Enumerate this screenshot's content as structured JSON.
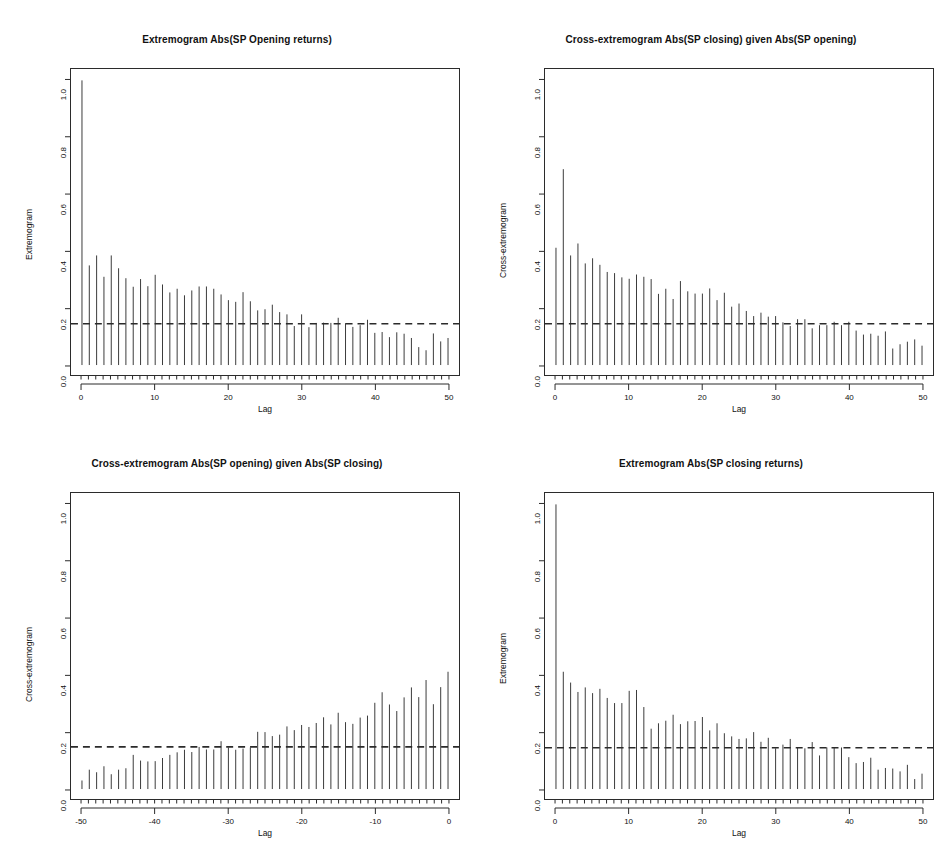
{
  "figure": {
    "width": 948,
    "height": 849,
    "background": "#ffffff",
    "bar_color": "#3a3a3a",
    "axis_color": "#2b2b2b",
    "ci_color": "#2b2b2b",
    "panel_count": 4
  },
  "chart_data": [
    {
      "id": "panel-a",
      "type": "bar",
      "title": "Extremogram Abs(SP Opening returns)",
      "xlabel": "Lag",
      "ylabel": "Extremogram",
      "xlim": [
        -1.5,
        51.5
      ],
      "ylim": [
        -0.035,
        1.04
      ],
      "xticks": [
        0,
        10,
        20,
        30,
        40,
        50
      ],
      "xtick_labels": [
        "0",
        "10",
        "20",
        "30",
        "40",
        "50"
      ],
      "yticks": [
        0.0,
        0.2,
        0.4,
        0.6,
        0.8,
        1.0
      ],
      "ytick_labels": [
        "0.0",
        "0.2",
        "0.4",
        "0.6",
        "0.8",
        "1.0"
      ],
      "grid": false,
      "legend": "none",
      "confidence_level": 0.145,
      "confidence_style": "dashed",
      "x": [
        0,
        1,
        2,
        3,
        4,
        5,
        6,
        7,
        8,
        9,
        10,
        11,
        12,
        13,
        14,
        15,
        16,
        17,
        18,
        19,
        20,
        21,
        22,
        23,
        24,
        25,
        26,
        27,
        28,
        29,
        30,
        31,
        32,
        33,
        34,
        35,
        36,
        37,
        38,
        39,
        40,
        41,
        42,
        43,
        44,
        45,
        46,
        47,
        48,
        49,
        50
      ],
      "values": [
        1.0,
        0.35,
        0.385,
        0.31,
        0.385,
        0.34,
        0.305,
        0.275,
        0.302,
        0.277,
        0.317,
        0.283,
        0.255,
        0.268,
        0.245,
        0.262,
        0.276,
        0.276,
        0.268,
        0.248,
        0.228,
        0.222,
        0.256,
        0.224,
        0.192,
        0.196,
        0.212,
        0.186,
        0.178,
        0.137,
        0.178,
        0.133,
        0.148,
        0.149,
        0.148,
        0.166,
        0.147,
        0.134,
        0.14,
        0.159,
        0.113,
        0.116,
        0.098,
        0.115,
        0.11,
        0.095,
        0.063,
        0.052,
        0.111,
        0.083,
        0.095
      ]
    },
    {
      "id": "panel-b",
      "type": "bar",
      "title": "Cross-extremogram Abs(SP closing) given Abs(SP opening)",
      "xlabel": "Lag",
      "ylabel": "Cross-extremogram",
      "xlim": [
        -1.5,
        51.5
      ],
      "ylim": [
        -0.035,
        1.04
      ],
      "xticks": [
        0,
        10,
        20,
        30,
        40,
        50
      ],
      "xtick_labels": [
        "0",
        "10",
        "20",
        "30",
        "40",
        "50"
      ],
      "yticks": [
        0.0,
        0.2,
        0.4,
        0.6,
        0.8,
        1.0
      ],
      "ytick_labels": [
        "0.0",
        "0.2",
        "0.4",
        "0.6",
        "0.8",
        "1.0"
      ],
      "grid": false,
      "legend": "none",
      "confidence_level": 0.145,
      "confidence_style": "dashed",
      "x": [
        0,
        1,
        2,
        3,
        4,
        5,
        6,
        7,
        8,
        9,
        10,
        11,
        12,
        13,
        14,
        15,
        16,
        17,
        18,
        19,
        20,
        21,
        22,
        23,
        24,
        25,
        26,
        27,
        28,
        29,
        30,
        31,
        32,
        33,
        34,
        35,
        36,
        37,
        38,
        39,
        40,
        41,
        42,
        43,
        44,
        45,
        46,
        47,
        48,
        49,
        50
      ],
      "values": [
        0.412,
        0.688,
        0.385,
        0.427,
        0.357,
        0.375,
        0.352,
        0.327,
        0.323,
        0.308,
        0.303,
        0.318,
        0.31,
        0.302,
        0.25,
        0.268,
        0.232,
        0.295,
        0.259,
        0.251,
        0.251,
        0.269,
        0.228,
        0.254,
        0.205,
        0.216,
        0.19,
        0.172,
        0.184,
        0.17,
        0.172,
        0.15,
        0.137,
        0.161,
        0.161,
        0.129,
        0.14,
        0.14,
        0.152,
        0.14,
        0.152,
        0.121,
        0.107,
        0.11,
        0.103,
        0.118,
        0.058,
        0.073,
        0.082,
        0.09,
        0.068
      ]
    },
    {
      "id": "panel-c",
      "type": "bar",
      "title": "Cross-extremogram Abs(SP opening) given Abs(SP closing)",
      "xlabel": "Lag",
      "ylabel": "Cross-extremogram",
      "xlim": [
        -51.5,
        1.5
      ],
      "ylim": [
        -0.035,
        1.04
      ],
      "xticks": [
        -50,
        -40,
        -30,
        -20,
        -10,
        0
      ],
      "xtick_labels": [
        "-50",
        "-40",
        "-30",
        "-20",
        "-10",
        "0"
      ],
      "yticks": [
        0.0,
        0.2,
        0.4,
        0.6,
        0.8,
        1.0
      ],
      "ytick_labels": [
        "0.0",
        "0.2",
        "0.4",
        "0.6",
        "0.8",
        "1.0"
      ],
      "grid": false,
      "legend": "none",
      "confidence_level": 0.148,
      "confidence_style": "dashed",
      "x": [
        -50,
        -49,
        -48,
        -47,
        -46,
        -45,
        -44,
        -43,
        -42,
        -41,
        -40,
        -39,
        -38,
        -37,
        -36,
        -35,
        -34,
        -33,
        -32,
        -31,
        -30,
        -29,
        -28,
        -27,
        -26,
        -25,
        -24,
        -23,
        -22,
        -21,
        -20,
        -19,
        -18,
        -17,
        -16,
        -15,
        -14,
        -13,
        -12,
        -11,
        -10,
        -9,
        -8,
        -7,
        -6,
        -5,
        -4,
        -3,
        -2,
        -1,
        0
      ],
      "values": [
        0.03,
        0.068,
        0.059,
        0.08,
        0.052,
        0.068,
        0.073,
        0.12,
        0.1,
        0.097,
        0.098,
        0.109,
        0.12,
        0.129,
        0.138,
        0.13,
        0.148,
        0.139,
        0.139,
        0.168,
        0.146,
        0.138,
        0.142,
        0.146,
        0.201,
        0.2,
        0.186,
        0.191,
        0.22,
        0.207,
        0.225,
        0.218,
        0.232,
        0.252,
        0.227,
        0.268,
        0.235,
        0.229,
        0.251,
        0.258,
        0.303,
        0.34,
        0.297,
        0.274,
        0.322,
        0.357,
        0.323,
        0.383,
        0.298,
        0.358,
        0.412
      ]
    },
    {
      "id": "panel-d",
      "type": "bar",
      "title": "Extremogram Abs(SP closing returns)",
      "xlabel": "Lag",
      "ylabel": "Extremogram",
      "xlim": [
        -1.5,
        51.5
      ],
      "ylim": [
        -0.035,
        1.04
      ],
      "xticks": [
        0,
        10,
        20,
        30,
        40,
        50
      ],
      "xtick_labels": [
        "0",
        "10",
        "20",
        "30",
        "40",
        "50"
      ],
      "yticks": [
        0.0,
        0.2,
        0.4,
        0.6,
        0.8,
        1.0
      ],
      "ytick_labels": [
        "0.0",
        "0.2",
        "0.4",
        "0.6",
        "0.8",
        "1.0"
      ],
      "grid": false,
      "legend": "none",
      "confidence_level": 0.145,
      "confidence_style": "dashed",
      "x": [
        0,
        1,
        2,
        3,
        4,
        5,
        6,
        7,
        8,
        9,
        10,
        11,
        12,
        13,
        14,
        15,
        16,
        17,
        18,
        19,
        20,
        21,
        22,
        23,
        24,
        25,
        26,
        27,
        28,
        29,
        30,
        31,
        32,
        33,
        34,
        35,
        36,
        37,
        38,
        39,
        40,
        41,
        42,
        43,
        44,
        45,
        46,
        47,
        48,
        49,
        50
      ],
      "values": [
        1.0,
        0.412,
        0.374,
        0.341,
        0.357,
        0.337,
        0.352,
        0.32,
        0.302,
        0.302,
        0.345,
        0.348,
        0.288,
        0.212,
        0.231,
        0.24,
        0.261,
        0.228,
        0.238,
        0.239,
        0.253,
        0.206,
        0.231,
        0.196,
        0.185,
        0.176,
        0.178,
        0.2,
        0.166,
        0.18,
        0.143,
        0.156,
        0.176,
        0.145,
        0.143,
        0.165,
        0.118,
        0.146,
        0.147,
        0.146,
        0.112,
        0.091,
        0.095,
        0.11,
        0.068,
        0.074,
        0.072,
        0.062,
        0.085,
        0.035,
        0.054
      ]
    }
  ]
}
